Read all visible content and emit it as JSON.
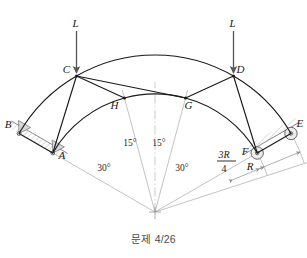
{
  "figure": {
    "caption": "문제 4/26",
    "background_color": "#ffffff",
    "member_color": "#1a1a1a",
    "construction_color": "#9a9a9a",
    "hatch_color": "#b5b5b5",
    "support_fill": "#d8d8d8"
  },
  "geometry": {
    "center_x": 155,
    "center_y": 212,
    "outer_radius": 157,
    "inner_radius": 118,
    "note": "angles measured in degrees from vertical, negative = left",
    "node_angles_deg": {
      "B": -60,
      "C": -30,
      "D": 30,
      "E": 60,
      "A": -60,
      "H": -15,
      "G": 15,
      "F": 60
    }
  },
  "nodes": [
    {
      "id": "A",
      "label": "A",
      "ring": "inner",
      "angle_deg": -60,
      "label_dx": 9,
      "label_dy": 6,
      "support": "pin"
    },
    {
      "id": "B",
      "label": "B",
      "ring": "outer",
      "angle_deg": -60,
      "label_dx": -11,
      "label_dy": -6,
      "support": "pin"
    },
    {
      "id": "C",
      "label": "C",
      "ring": "outer",
      "angle_deg": -30,
      "label_dx": -10,
      "label_dy": -3,
      "support": "none"
    },
    {
      "id": "D",
      "label": "D",
      "ring": "outer",
      "angle_deg": 30,
      "label_dx": 7,
      "label_dy": -3,
      "support": "none"
    },
    {
      "id": "E",
      "label": "E",
      "ring": "outer",
      "angle_deg": 60,
      "label_dx": 9,
      "label_dy": -7,
      "support": "roller"
    },
    {
      "id": "F",
      "label": "F",
      "ring": "inner",
      "angle_deg": 60,
      "label_dx": -12,
      "label_dy": 2,
      "support": "roller"
    },
    {
      "id": "G",
      "label": "G",
      "ring": "inner",
      "angle_deg": 15,
      "label_dx": 3,
      "label_dy": 11,
      "support": "none"
    },
    {
      "id": "H",
      "label": "H",
      "ring": "inner",
      "angle_deg": -15,
      "label_dx": -10,
      "label_dy": 11,
      "support": "none"
    }
  ],
  "members": [
    {
      "from": "B",
      "to": "C",
      "type": "arc-outer"
    },
    {
      "from": "C",
      "to": "D",
      "type": "arc-outer"
    },
    {
      "from": "D",
      "to": "E",
      "type": "arc-outer"
    },
    {
      "from": "A",
      "to": "H",
      "type": "arc-inner"
    },
    {
      "from": "H",
      "to": "G",
      "type": "arc-inner"
    },
    {
      "from": "G",
      "to": "F",
      "type": "arc-inner"
    },
    {
      "from": "A",
      "to": "B",
      "type": "straight"
    },
    {
      "from": "A",
      "to": "C",
      "type": "straight"
    },
    {
      "from": "C",
      "to": "H",
      "type": "straight"
    },
    {
      "from": "C",
      "to": "G",
      "type": "straight"
    },
    {
      "from": "D",
      "to": "G",
      "type": "straight"
    },
    {
      "from": "D",
      "to": "F",
      "type": "straight"
    },
    {
      "from": "E",
      "to": "F",
      "type": "straight"
    }
  ],
  "loads": [
    {
      "id": "load-c",
      "label": "L",
      "at_node": "C",
      "direction": "down",
      "length": 42
    },
    {
      "id": "load-d",
      "label": "L",
      "at_node": "D",
      "direction": "down",
      "length": 42
    }
  ],
  "angle_dimensions": [
    {
      "id": "angle-left-15",
      "value": "15°",
      "x": 130,
      "y": 146
    },
    {
      "id": "angle-right-15",
      "value": "15°",
      "x": 159,
      "y": 146
    },
    {
      "id": "angle-left-30",
      "value": "30°",
      "x": 104,
      "y": 171
    },
    {
      "id": "angle-right-30",
      "value": "30°",
      "x": 182,
      "y": 171
    }
  ],
  "radius_dimensions": [
    {
      "id": "dim-three-r-over-four",
      "numerator": "3R",
      "denominator": "4",
      "num_x": 224,
      "num_y": 158,
      "bar_x1": 217,
      "bar_x2": 236,
      "bar_y": 161,
      "den_x": 224,
      "den_y": 172
    },
    {
      "id": "dim-r",
      "label": "R",
      "x": 250,
      "y": 170
    }
  ],
  "radial_construction_lines": [
    {
      "id": "radial-A",
      "angle_deg": -60,
      "radius": 126
    },
    {
      "id": "radial-H",
      "angle_deg": -15,
      "radius": 126
    },
    {
      "id": "radial-center",
      "angle_deg": 0,
      "radius": 130,
      "style": "dash-dot"
    },
    {
      "id": "radial-G",
      "angle_deg": 15,
      "radius": 126
    },
    {
      "id": "radial-F",
      "angle_deg": 60,
      "radius": 126
    },
    {
      "id": "radial-E",
      "angle_deg": 72,
      "radius": 172
    }
  ]
}
